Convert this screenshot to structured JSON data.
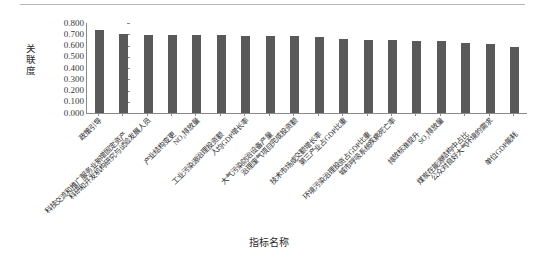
{
  "chart_data": {
    "type": "bar",
    "title": "",
    "xlabel": "指标名称",
    "ylabel": "关联度",
    "ylim": [
      0.0,
      0.8
    ],
    "ytick_labels": [
      "0.800",
      "0.700",
      "0.600",
      "0.500",
      "0.400",
      "0.300",
      "0.200",
      "0.100",
      "0.000"
    ],
    "ytick_values": [
      0.8,
      0.7,
      0.6,
      0.5,
      0.4,
      0.3,
      0.2,
      0.1,
      0.0
    ],
    "grid": false,
    "legend": "none",
    "bar_color": "#595959",
    "categories": [
      "政策引导",
      "科技交流和推广服务业新增固定资产",
      "科研和开发机构研究与试验发展人员",
      "产业结构变更",
      "NO₂排放量",
      "工业污染源治理投资额",
      "人均GDP增长率",
      "大气污染防治设备产量",
      "治理废气项目完成投资额",
      "技术市场成交额增长率",
      "第三产业占GDP比重",
      "环境污染治理投资占GDP比重",
      "城市呼吸系统疾病死亡率",
      "排放标准提升",
      "SO₂排放量",
      "煤炭在能源结构中占比",
      "公众对良好大气环境的需求",
      "单位GDP能耗"
    ],
    "values": [
      0.735,
      0.7,
      0.697,
      0.695,
      0.693,
      0.69,
      0.689,
      0.685,
      0.683,
      0.672,
      0.66,
      0.648,
      0.645,
      0.642,
      0.638,
      0.62,
      0.612,
      0.585
    ]
  }
}
